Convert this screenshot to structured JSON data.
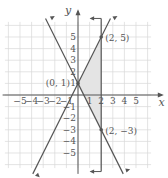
{
  "chart_data": {
    "type": "line",
    "title": "",
    "xlabel": "x",
    "ylabel": "y",
    "xlim": [
      -6,
      6
    ],
    "ylim": [
      -6,
      6
    ],
    "grid": true,
    "x_ticks": [
      "-5",
      "-4",
      "-3",
      "-2",
      "-1",
      "1",
      "2",
      "3",
      "4",
      "5"
    ],
    "y_ticks": [
      "5",
      "4",
      "3",
      "2",
      "1",
      "-1",
      "-2",
      "-3",
      "-4",
      "-5"
    ],
    "series": [
      {
        "name": "y = 2x + 1",
        "type": "line",
        "slope": 2,
        "intercept": 1
      },
      {
        "name": "y = -2x + 1",
        "type": "line",
        "slope": -2,
        "intercept": 1
      },
      {
        "name": "x = 2",
        "type": "vertical",
        "x": 2
      }
    ],
    "shaded_region": {
      "vertices": [
        [
          0,
          1
        ],
        [
          2,
          5
        ],
        [
          2,
          -3
        ]
      ],
      "note": "triangle bounded by the three lines (shaded between y-axis side and x=2)"
    },
    "points": [
      {
        "label": "(0, 1)",
        "x": 0,
        "y": 1
      },
      {
        "label": "(2, 5)",
        "x": 2,
        "y": 5
      },
      {
        "label": "(2, −3)",
        "x": 2,
        "y": -3
      }
    ]
  },
  "labels": {
    "x_axis": "x",
    "y_axis": "y",
    "p1": "(0, 1)",
    "p2": "(2, 5)",
    "p3": "(2, −3)"
  },
  "colors": {
    "grid": "#d8d8d8",
    "axis": "#555555",
    "line": "#555555",
    "shade": "#e4e4e4"
  }
}
